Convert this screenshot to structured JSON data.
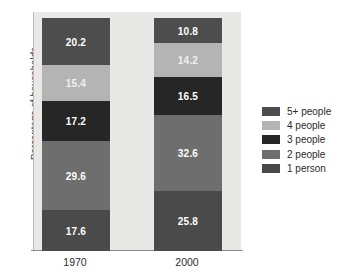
{
  "chart_data": {
    "type": "bar",
    "subtype": "stacked-bar-100",
    "title": "",
    "xlabel": "",
    "ylabel": "Percentage of households",
    "categories": [
      "1970",
      "2000"
    ],
    "ylim": [
      0,
      100
    ],
    "grid": false,
    "legend_position": "right",
    "series": [
      {
        "name": "1 person",
        "color": "#4a4a4a",
        "values": [
          17.6,
          25.8
        ],
        "labels": [
          "17.6",
          "25.8"
        ]
      },
      {
        "name": "2 people",
        "color": "#6e6e6e",
        "values": [
          29.6,
          32.6
        ],
        "labels": [
          "29.6",
          "32.6"
        ]
      },
      {
        "name": "3 people",
        "color": "#262626",
        "values": [
          17.2,
          16.5
        ],
        "labels": [
          "17.2",
          "16.5"
        ]
      },
      {
        "name": "4 people",
        "color": "#b4b4b4",
        "values": [
          15.4,
          14.2
        ],
        "labels": [
          "15.4",
          "14.2"
        ]
      },
      {
        "name": "5+ people",
        "color": "#4d4d4d",
        "values": [
          20.2,
          10.8
        ],
        "labels": [
          "20.2",
          "10.8"
        ]
      }
    ],
    "legend": [
      {
        "label": "5+ people",
        "color": "#4d4d4d"
      },
      {
        "label": "4 people",
        "color": "#b4b4b4"
      },
      {
        "label": "3 people",
        "color": "#262626"
      },
      {
        "label": "2 people",
        "color": "#6e6e6e"
      },
      {
        "label": "1 person",
        "color": "#4a4a4a"
      }
    ],
    "plot_background": "#e8e8e6"
  }
}
